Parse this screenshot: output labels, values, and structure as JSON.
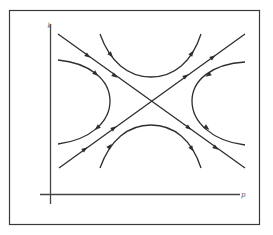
{
  "diagram": {
    "type": "phase-portrait",
    "axes": {
      "x_label": "p",
      "y_label": "k"
    },
    "colors": {
      "line": "#2e2e2e",
      "frame": "#3a3a3a",
      "background": "#ffffff"
    },
    "saddle_point": {
      "x": 151,
      "y": 101
    },
    "separatrices": [
      {
        "name": "descending",
        "from": [
          58,
          34
        ],
        "to": [
          245,
          168
        ],
        "flow": "top-left to bottom-right"
      },
      {
        "name": "ascending",
        "from": [
          59,
          168
        ],
        "to": [
          245,
          34
        ],
        "flow": "bottom-left to top-right"
      }
    ],
    "trajectories": [
      {
        "name": "top",
        "flow": "left to right"
      },
      {
        "name": "bottom",
        "flow": "left to right"
      },
      {
        "name": "left",
        "flow": "top to bottom"
      },
      {
        "name": "right",
        "flow": "top to bottom"
      }
    ]
  }
}
